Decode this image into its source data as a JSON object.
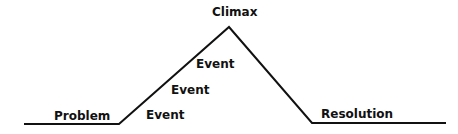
{
  "diagram": {
    "type": "plot-mountain",
    "labels": {
      "problem": "Problem",
      "event1": "Event",
      "event2": "Event",
      "event3": "Event",
      "climax": "Climax",
      "resolution": "Resolution"
    },
    "line_color": "#111111"
  }
}
